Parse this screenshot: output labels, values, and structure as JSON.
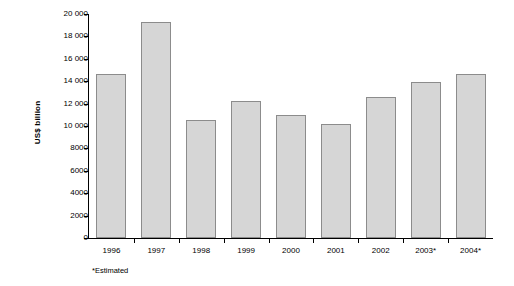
{
  "chart_data": {
    "type": "bar",
    "title": "",
    "subtitle": "",
    "xlabel": "",
    "ylabel": "US$ billion",
    "categories": [
      "1996",
      "1997",
      "1998",
      "1999",
      "2000",
      "2001",
      "2002",
      "2003*",
      "2004*"
    ],
    "values": [
      14600,
      19300,
      10500,
      12200,
      11000,
      10200,
      12600,
      13900,
      14650
    ],
    "ylim": [
      0,
      20000
    ],
    "yticks": [
      0,
      2000,
      4000,
      6000,
      8000,
      10000,
      12000,
      14000,
      16000,
      18000,
      20000
    ],
    "ytick_labels": [
      "0",
      "2000",
      "4000",
      "6000",
      "8000",
      "10 000",
      "12 000",
      "14 000",
      "16 000",
      "18 000",
      "20 000"
    ],
    "grid": false,
    "legend": null,
    "bar_color": "#d6d6d6",
    "bar_border_color": "#8c8c8c",
    "annotations": [
      "*Estimated"
    ]
  },
  "footnote": "*Estimated"
}
